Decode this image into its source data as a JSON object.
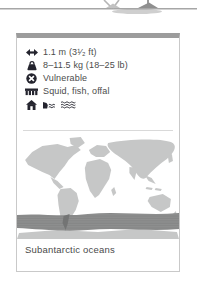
{
  "card": {
    "stats": [
      {
        "name": "length",
        "icon": "length-arrows-icon",
        "label": "1.1 m (3¹⁄₂ ft)"
      },
      {
        "name": "weight",
        "icon": "weight-icon",
        "label": "8–11.5 kg (18–25 lb)"
      },
      {
        "name": "status",
        "icon": "status-vulnerable-icon",
        "label": "Vulnerable"
      },
      {
        "name": "diet",
        "icon": "diet-icon",
        "label": "Squid, fish, offal"
      }
    ],
    "habitat_icons": [
      "home-icon",
      "coast-icon",
      "open-ocean-icon"
    ],
    "map_caption": "Subantarctic oceans"
  },
  "map": {
    "type": "world-distribution-map",
    "highlight_region": "Subantarctic oceans",
    "land_color": "#c6c7c7",
    "highlight_color": "#8e8f8f"
  },
  "colors": {
    "card_border": "#c9c9c9",
    "card_top_border": "#9c9c9c",
    "text": "#4b4b4b",
    "icon": "#24242e",
    "divider": "#d9d9d9",
    "ground_line": "#a6a6a6"
  }
}
